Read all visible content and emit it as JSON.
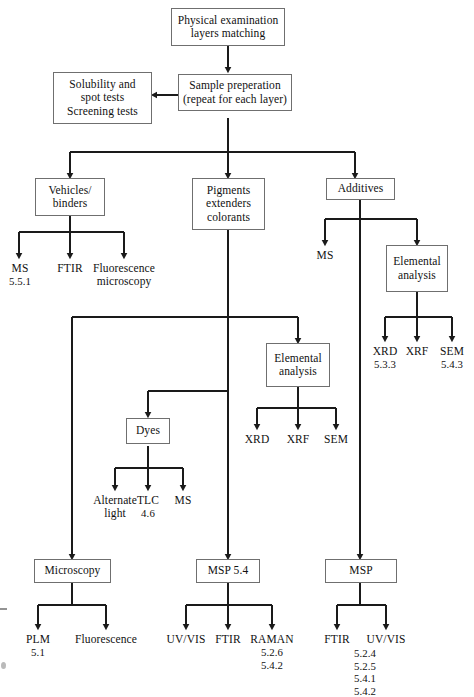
{
  "diagram": {
    "type": "flowchart",
    "nodes": {
      "physical_exam": {
        "line1": "Physical examination",
        "line2": "layers matching"
      },
      "sample_prep": {
        "line1": "Sample preperation",
        "line2": "(repeat for each layer)"
      },
      "solubility": {
        "line1": "Solubility and",
        "line2": "spot tests",
        "line3": "Screening tests"
      },
      "vehicles": {
        "line1": "Vehicles/",
        "line2": "binders"
      },
      "pigments": {
        "line1": "Pigments",
        "line2": "extenders",
        "line3": "colorants"
      },
      "additives": {
        "line1": "Additives"
      },
      "elemental_additives": {
        "line1": "Elemental",
        "line2": "analysis"
      },
      "elemental_pigments": {
        "line1": "Elemental",
        "line2": "analysis"
      },
      "dyes": {
        "line1": "Dyes"
      },
      "microscopy": {
        "line1": "Microscopy"
      },
      "msp_54": {
        "line1": "MSP 5.4"
      },
      "msp": {
        "line1": "MSP"
      }
    },
    "leaves": {
      "veh_ms": {
        "label": "MS",
        "refs": "5.5.1"
      },
      "veh_ftir": {
        "label": "FTIR",
        "refs": ""
      },
      "veh_fluor": {
        "label": "Fluorescence",
        "label2": "microscopy",
        "refs": ""
      },
      "add_ms": {
        "label": "MS",
        "refs": ""
      },
      "add_xrd": {
        "label": "XRD",
        "refs": "5.3.3"
      },
      "add_xrf": {
        "label": "XRF",
        "refs": ""
      },
      "add_sem": {
        "label": "SEM",
        "refs": "5.4.3"
      },
      "pig_xrd": {
        "label": "XRD",
        "refs": ""
      },
      "pig_xrf": {
        "label": "XRF",
        "refs": ""
      },
      "pig_sem": {
        "label": "SEM",
        "refs": ""
      },
      "dye_alt": {
        "label": "Alternate",
        "label2": "light",
        "refs": ""
      },
      "dye_tlc": {
        "label": "TLC",
        "refs": "4.6"
      },
      "dye_ms": {
        "label": "MS",
        "refs": ""
      },
      "mic_plm": {
        "label": "PLM",
        "refs": "5.1"
      },
      "mic_fluor": {
        "label": "Fluorescence",
        "refs": ""
      },
      "msp54_uvvis": {
        "label": "UV/VIS",
        "refs": ""
      },
      "msp54_ftir": {
        "label": "FTIR",
        "refs": ""
      },
      "msp54_raman": {
        "label": "RAMAN",
        "refs": "5.2.6\n5.4.2"
      },
      "msp_ftir": {
        "label": "FTIR",
        "refs": ""
      },
      "msp_uvvis": {
        "label": "UV/VIS",
        "refs": ""
      },
      "msp_reflist": {
        "label": "",
        "refs": "5.2.4\n5.2.5\n5.4.1\n5.4.2"
      }
    },
    "colors": {
      "line": "#1a1a1a",
      "box_border": "#6f6f6f",
      "background": "#ffffff",
      "text": "#111111"
    }
  }
}
